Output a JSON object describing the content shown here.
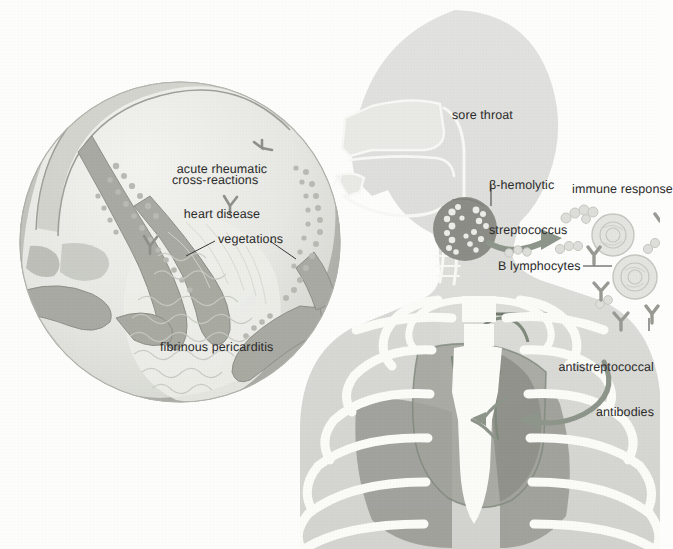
{
  "figure": {
    "background_color": "#fdfdfc"
  },
  "colors": {
    "body_fill": "#dedede",
    "body_fill_dark": "#cfcfca",
    "bone": "#fbfbf8",
    "lung": "#9d9d98",
    "heart": "#8f8f8a",
    "tonsil_dark": "#8a8a85",
    "inset_rim": "#b9bab4",
    "inset_fill": "#e9eae5",
    "valve": "#a9aaa3",
    "arrow": "#8f968c",
    "leader": "#3a3a3a",
    "text": "#2b2b2b"
  },
  "inset": {
    "name": "heart-valve-inset",
    "labels": {
      "disease_line1": "acute rheumatic",
      "disease_line2": "heart disease",
      "cross_reactions": "cross-reactions",
      "vegetations": "vegetations",
      "pericarditis": "fibrinous pericarditis"
    }
  },
  "body": {
    "name": "body-silhouette",
    "labels": {
      "sore_throat": "sore throat",
      "strep_line1": "β-hemolytic",
      "strep_line2": "streptococcus"
    }
  },
  "immune": {
    "name": "immune-response-group",
    "labels": {
      "immune_response": "immune response",
      "b_lymphocytes": "B lymphocytes",
      "antibodies_line1": "antistreptococcal",
      "antibodies_line2": "antibodies"
    }
  }
}
